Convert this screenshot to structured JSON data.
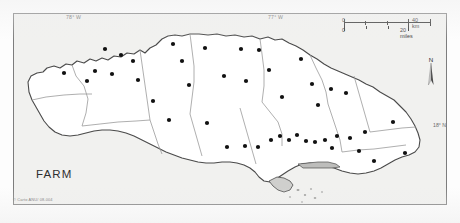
{
  "figure": {
    "title": "FARM",
    "credit": "© Carto ANU/ 08-004",
    "frame_color": "#7d7d7d",
    "land_fill": "#ffffff",
    "sea_fill": "#f1f1ef",
    "boundary_color": "#8c8c8c",
    "coast_color": "#3b3b3b",
    "dot_color": "#111111"
  },
  "graticule": {
    "longitude_labels": [
      {
        "id": "lon-78",
        "text": "78° W"
      },
      {
        "id": "lon-77",
        "text": "77° W"
      }
    ],
    "latitude_labels": [
      {
        "id": "lat-18",
        "text": "18° N"
      }
    ]
  },
  "scalebar": {
    "km": {
      "start": "0",
      "end": "40 km",
      "divisions": 4,
      "length_px": 86
    },
    "miles": {
      "start": "0",
      "end": "20 miles",
      "divisions": 4,
      "length_px": 86
    }
  },
  "compass": {
    "letter": "N",
    "icon": "north-arrow-icon"
  },
  "chart_data": {
    "type": "scatter",
    "title": "FARM",
    "xlabel": "",
    "ylabel": "",
    "projection_extent_deg": {
      "lon_min": -78.45,
      "lon_max": -76.15,
      "lat_min": 17.62,
      "lat_max": 18.58
    },
    "legend_position": "none",
    "grid": false,
    "point_count": 44,
    "points_px": [
      [
        104,
        48
      ],
      [
        120,
        54
      ],
      [
        132,
        60
      ],
      [
        94,
        70
      ],
      [
        111,
        73
      ],
      [
        63,
        72
      ],
      [
        86,
        80
      ],
      [
        137,
        79
      ],
      [
        172,
        43
      ],
      [
        181,
        60
      ],
      [
        188,
        84
      ],
      [
        204,
        47
      ],
      [
        240,
        48
      ],
      [
        258,
        49
      ],
      [
        223,
        75
      ],
      [
        245,
        80
      ],
      [
        268,
        69
      ],
      [
        281,
        96
      ],
      [
        300,
        58
      ],
      [
        311,
        83
      ],
      [
        317,
        104
      ],
      [
        330,
        88
      ],
      [
        345,
        92
      ],
      [
        152,
        100
      ],
      [
        168,
        119
      ],
      [
        206,
        122
      ],
      [
        226,
        146
      ],
      [
        244,
        145
      ],
      [
        257,
        146
      ],
      [
        270,
        139
      ],
      [
        279,
        135
      ],
      [
        288,
        139
      ],
      [
        296,
        134
      ],
      [
        305,
        140
      ],
      [
        314,
        141
      ],
      [
        324,
        139
      ],
      [
        331,
        147
      ],
      [
        336,
        135
      ],
      [
        349,
        137
      ],
      [
        358,
        150
      ],
      [
        364,
        131
      ],
      [
        373,
        160
      ],
      [
        392,
        121
      ],
      [
        404,
        152
      ]
    ]
  }
}
